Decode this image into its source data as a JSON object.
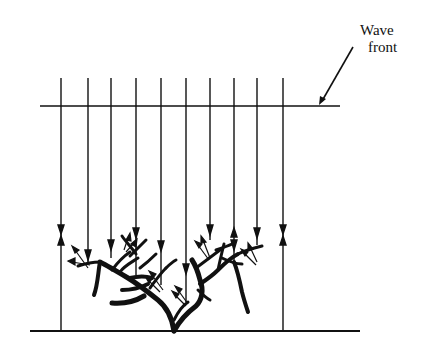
{
  "diagram": {
    "label_line1": "Wave",
    "label_line2": "front",
    "ink_color": "#111111",
    "background": "#ffffff",
    "ray_x_positions": [
      61,
      88,
      111,
      136,
      161,
      186,
      210,
      234,
      257,
      283
    ],
    "wavefront_y": 106,
    "surface_y": 331,
    "ray_top_y": 78
  }
}
